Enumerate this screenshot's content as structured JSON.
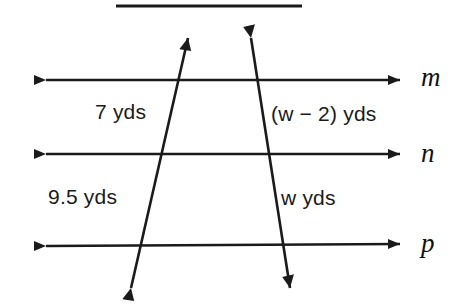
{
  "figure": {
    "type": "geometry-diagram",
    "background_color": "#ffffff",
    "stroke_color": "#1a1a1a"
  },
  "top_rule": {
    "name": "top-rule",
    "x1": 116,
    "y1": 6,
    "x2": 302,
    "y2": 6
  },
  "parallel_lines": [
    {
      "id": "m",
      "label": "m",
      "y": 80,
      "x_start": 34,
      "x_end": 412
    },
    {
      "id": "n",
      "label": "n",
      "y": 154,
      "x_start": 34,
      "x_end": 412
    },
    {
      "id": "p",
      "label": "p",
      "y": 245,
      "x_start": 34,
      "x_end": 412
    }
  ],
  "transversals": [
    {
      "id": "left-transversal",
      "top_x": 190,
      "top_y": 26,
      "bottom_x": 128,
      "bottom_y": 300,
      "intersections": {
        "m": 185,
        "n": 165,
        "p": 138
      }
    },
    {
      "id": "right-transversal",
      "top_x": 250,
      "top_y": 25,
      "bottom_x": 292,
      "bottom_y": 300,
      "intersections": {
        "m": 258,
        "n": 268,
        "p": 285
      }
    }
  ],
  "segment_labels": {
    "left_upper": "7 yds",
    "right_upper": "(w − 2) yds",
    "left_lower": "9.5 yds",
    "right_lower": "w yds"
  },
  "line_labels": {
    "m": "m",
    "n": "n",
    "p": "p"
  }
}
